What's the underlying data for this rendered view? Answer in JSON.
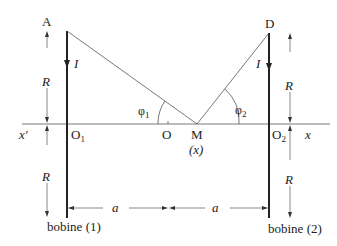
{
  "diagram": {
    "points": {
      "A": "A",
      "D": "D",
      "O1": "O",
      "O1_sub": "1",
      "O": "O",
      "M": "M",
      "M_coord": "(x)",
      "O2": "O",
      "O2_sub": "2",
      "x_prime": "x′",
      "x": "x"
    },
    "labels": {
      "current_left": "I",
      "current_right": "I",
      "radius_left_top": "R",
      "radius_left_bottom": "R",
      "radius_right_top": "R",
      "radius_right_bottom": "R",
      "angle_1": "φ",
      "angle_1_sub": "1",
      "angle_2": "φ",
      "angle_2_sub": "2",
      "dist_left": "a",
      "dist_right": "a",
      "coil_1": "bobine (1)",
      "coil_2": "bobine (2)"
    },
    "colors": {
      "line": "#222222",
      "thin_line": "#555555",
      "background": "#ffffff"
    }
  }
}
